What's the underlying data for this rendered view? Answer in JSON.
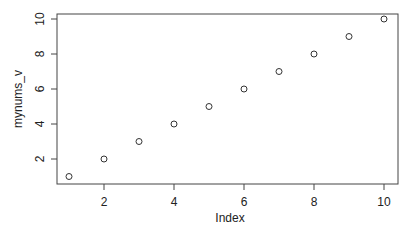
{
  "chart_data": {
    "type": "scatter",
    "title": "",
    "xlabel": "Index",
    "ylabel": "mynums_v",
    "x": [
      1,
      2,
      3,
      4,
      5,
      6,
      7,
      8,
      9,
      10
    ],
    "y": [
      1,
      2,
      3,
      4,
      5,
      6,
      7,
      8,
      9,
      10
    ],
    "xticks": [
      "2",
      "4",
      "6",
      "8",
      "10"
    ],
    "yticks": [
      "2",
      "4",
      "6",
      "8",
      "10"
    ],
    "xlim": [
      0.64,
      10.36
    ],
    "ylim": [
      0.64,
      10.36
    ],
    "grid": false,
    "marker": "open-circle"
  }
}
